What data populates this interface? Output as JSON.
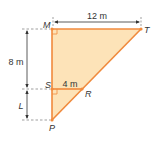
{
  "diagram": {
    "colors": {
      "fill": "#fde3b8",
      "edge": "#f08a3c",
      "dim": "#333333",
      "dash": "#777777"
    },
    "points": {
      "M": "M",
      "T": "T",
      "S": "S",
      "R": "R",
      "P": "P"
    },
    "dimensions": {
      "MT": "12 m",
      "MS": "8 m",
      "SR": "4 m",
      "SP": "L"
    }
  }
}
